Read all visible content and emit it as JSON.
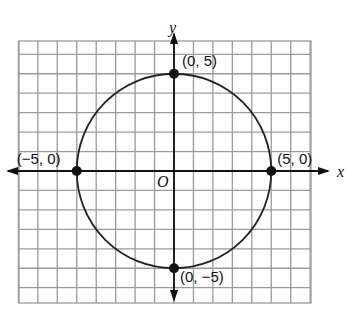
{
  "diagram": {
    "type": "circle-on-coordinate-grid",
    "equation": "x^2 + y^2 = 25",
    "grid": {
      "x_min": -8,
      "x_max": 7,
      "y_min": -7,
      "y_max": 7,
      "spacing_units": 1
    },
    "axes": {
      "x_label": "x",
      "y_label": "y",
      "origin_label": "O"
    },
    "circle": {
      "center": [
        0,
        0
      ],
      "radius": 5
    },
    "points": [
      {
        "id": "top",
        "coords": [
          0,
          5
        ],
        "label": "(0, 5)"
      },
      {
        "id": "right",
        "coords": [
          5,
          0
        ],
        "label": "(5, 0)"
      },
      {
        "id": "left",
        "coords": [
          -5,
          0
        ],
        "label": "(−5, 0)"
      },
      {
        "id": "bottom",
        "coords": [
          0,
          -5
        ],
        "label": "(0, −5)"
      }
    ],
    "colors": {
      "grid": "#9a9a9a",
      "axis": "#111111",
      "curve": "#222222"
    }
  }
}
